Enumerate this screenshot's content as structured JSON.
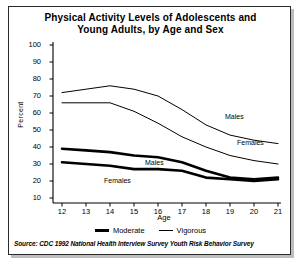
{
  "chart_data": {
    "type": "line",
    "title": "Physical Activity Levels of Adolescents and Young Adults, by Age and Sex",
    "title_line1": "Physical Activity Levels of Adolescents and",
    "title_line2": "Young Adults, by Age and Sex",
    "xlabel": "Age",
    "ylabel": "Percent",
    "x": [
      12,
      13,
      14,
      15,
      16,
      17,
      18,
      19,
      20,
      21
    ],
    "xtick_labels": [
      "12",
      "13",
      "14",
      "15",
      "16",
      "17",
      "18",
      "19",
      "20",
      "21"
    ],
    "ytick_labels": [
      "100",
      "90",
      "80",
      "70",
      "60",
      "50",
      "40",
      "30",
      "20",
      "10"
    ],
    "ytick_values": [
      100,
      90,
      80,
      70,
      60,
      50,
      40,
      30,
      20,
      10
    ],
    "xlim": [
      12,
      21
    ],
    "ylim": [
      0,
      100
    ],
    "grid": false,
    "legend_position": "below-plot",
    "series": [
      {
        "name": "Vigorous, Males",
        "activity": "Vigorous",
        "sex": "Males",
        "style": "thin",
        "values": [
          72,
          74,
          76,
          74,
          70,
          62,
          53,
          47,
          44,
          42
        ],
        "annotation": "Males"
      },
      {
        "name": "Vigorous, Females",
        "activity": "Vigorous",
        "sex": "Females",
        "style": "thin",
        "values": [
          66,
          66,
          66,
          61,
          54,
          46,
          40,
          35,
          32,
          30
        ],
        "annotation": "Females"
      },
      {
        "name": "Moderate, Males",
        "activity": "Moderate",
        "sex": "Males",
        "style": "thick",
        "values": [
          39,
          38,
          37,
          35,
          34,
          31,
          26,
          22,
          21,
          22
        ],
        "annotation": "Males"
      },
      {
        "name": "Moderate, Females",
        "activity": "Moderate",
        "sex": "Females",
        "style": "thick",
        "values": [
          31,
          30,
          29,
          27,
          27,
          26,
          22,
          21,
          20,
          21
        ],
        "annotation": "Females"
      }
    ],
    "legend": [
      {
        "label": "Moderate",
        "style": "thick"
      },
      {
        "label": "Vigorous",
        "style": "thin"
      }
    ],
    "annotations": [
      {
        "text": "Males",
        "series": "Vigorous, Males"
      },
      {
        "text": "Females",
        "series": "Vigorous, Females"
      },
      {
        "text": "Males",
        "series": "Moderate, Males"
      },
      {
        "text": "Females",
        "series": "Moderate, Females"
      }
    ],
    "source": "Source: CDC 1992 National Health Interview Survey Youth Risk Behavior Survey"
  }
}
